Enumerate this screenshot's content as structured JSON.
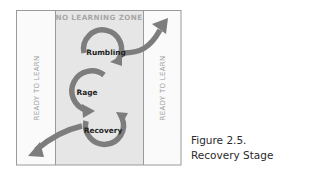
{
  "diagram": {
    "zone_title": "NO LEARNING ZONE",
    "left_label": "READY TO LEARN",
    "right_label": "READY TO LEARN",
    "stages": [
      "Rumbling",
      "Rage",
      "Recovery"
    ],
    "colors": {
      "zone_fill": "#e6e6e6",
      "side_fill": "#fafafa",
      "border": "#9a9a9a",
      "arrow": "#7d7d7d",
      "zone_title": "#a8a8a8",
      "side_label": "#a0a0a0",
      "stage_label": "#222222"
    }
  },
  "caption": {
    "line1": "Figure 2.5.",
    "line2": "Recovery Stage"
  }
}
